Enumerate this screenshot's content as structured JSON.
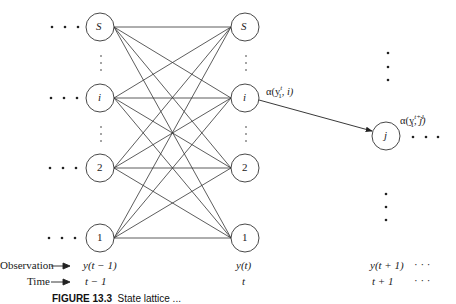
{
  "diagram": {
    "columns": [
      {
        "time": "t − 1",
        "observation": "y(t − 1)",
        "nodes": [
          "S",
          "i",
          "2",
          "1"
        ]
      },
      {
        "time": "t",
        "observation": "y(t)",
        "nodes": [
          "S",
          "i",
          "2",
          "1"
        ]
      },
      {
        "time": "t + 1",
        "observation": "y(t + 1)",
        "nodes": [
          "j"
        ]
      }
    ],
    "row_labels": {
      "observation": "Observation",
      "time": "Time"
    },
    "continuation": "· · ·",
    "alpha_labels": {
      "left_prefix": "α(y",
      "left_sup": "t",
      "left_sub": "1",
      "left_suffix": ", i)",
      "right_prefix": "α(y",
      "right_sup": "t+1",
      "right_sub": "1",
      "right_suffix": ", j)"
    },
    "caption": {
      "figure_label": "FIGURE 13.3",
      "text": "State lattice ..."
    }
  }
}
